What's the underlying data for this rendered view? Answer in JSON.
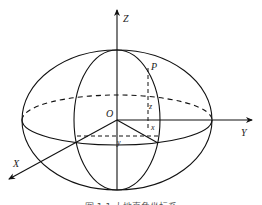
{
  "diagram": {
    "type": "3d-coordinate-ellipsoid",
    "labels": {
      "z_axis": "Z",
      "y_axis": "Y",
      "x_axis": "X",
      "origin": "O",
      "point": "P",
      "z_coord": "z",
      "x_coord": "x",
      "y_coord": "y"
    },
    "caption": "图 1-1  大地直角坐标系",
    "colors": {
      "stroke": "#111111",
      "background": "#ffffff"
    }
  }
}
